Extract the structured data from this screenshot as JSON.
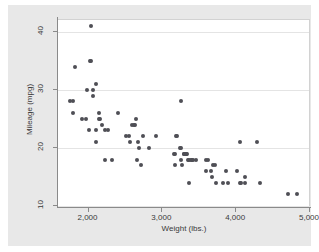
{
  "figure": {
    "background_color": "#e8e8e8",
    "plot_background_color": "#ffffff",
    "marker_color": "#4f4f55",
    "grid_color": "#e4e4e4",
    "axis_color": "#8a8a8a"
  },
  "chart_data": {
    "type": "scatter",
    "title": "",
    "xlabel": "Weight (lbs.)",
    "ylabel": "Mileage (mpg)",
    "xlim": [
      1600,
      5000
    ],
    "ylim": [
      10,
      42
    ],
    "xticks": [
      2000,
      3000,
      4000,
      5000
    ],
    "xtick_labels": [
      "2,000",
      "3,000",
      "4,000",
      "5,000"
    ],
    "yticks": [
      10,
      20,
      30,
      40
    ],
    "ytick_labels": [
      "10",
      "20",
      "30",
      "40"
    ],
    "grid": "horizontal",
    "legend": "none",
    "n_points": 74,
    "points": [
      [
        1760,
        28
      ],
      [
        1800,
        28
      ],
      [
        1800,
        26
      ],
      [
        1830,
        34
      ],
      [
        1930,
        25
      ],
      [
        1980,
        25
      ],
      [
        1990,
        30
      ],
      [
        2020,
        23
      ],
      [
        2040,
        35
      ],
      [
        2050,
        35
      ],
      [
        2050,
        41
      ],
      [
        2070,
        29
      ],
      [
        2070,
        30
      ],
      [
        2110,
        23
      ],
      [
        2120,
        21
      ],
      [
        2120,
        31
      ],
      [
        2160,
        26
      ],
      [
        2160,
        25
      ],
      [
        2170,
        25
      ],
      [
        2200,
        24
      ],
      [
        2230,
        23
      ],
      [
        2240,
        18
      ],
      [
        2280,
        23
      ],
      [
        2330,
        18
      ],
      [
        2410,
        26
      ],
      [
        2520,
        22
      ],
      [
        2560,
        22
      ],
      [
        2580,
        21
      ],
      [
        2600,
        24
      ],
      [
        2630,
        24
      ],
      [
        2640,
        24
      ],
      [
        2650,
        25
      ],
      [
        2670,
        18
      ],
      [
        2690,
        21
      ],
      [
        2700,
        20
      ],
      [
        2730,
        17
      ],
      [
        2750,
        22
      ],
      [
        2830,
        20
      ],
      [
        2930,
        22
      ],
      [
        3170,
        19
      ],
      [
        3180,
        19
      ],
      [
        3190,
        17
      ],
      [
        3200,
        22
      ],
      [
        3210,
        22
      ],
      [
        3250,
        20
      ],
      [
        3260,
        20
      ],
      [
        3260,
        28
      ],
      [
        3270,
        18
      ],
      [
        3280,
        17
      ],
      [
        3300,
        19
      ],
      [
        3310,
        19
      ],
      [
        3330,
        19
      ],
      [
        3340,
        19
      ],
      [
        3350,
        19
      ],
      [
        3360,
        18
      ],
      [
        3370,
        18
      ],
      [
        3380,
        14
      ],
      [
        3400,
        18
      ],
      [
        3420,
        18
      ],
      [
        3430,
        18
      ],
      [
        3470,
        18
      ],
      [
        3600,
        16
      ],
      [
        3610,
        18
      ],
      [
        3630,
        18
      ],
      [
        3670,
        16
      ],
      [
        3690,
        15
      ],
      [
        3700,
        17
      ],
      [
        3730,
        17
      ],
      [
        3740,
        14
      ],
      [
        3830,
        14
      ],
      [
        3880,
        16
      ],
      [
        3900,
        14
      ],
      [
        4030,
        16
      ],
      [
        4060,
        21
      ],
      [
        4060,
        14
      ],
      [
        4080,
        14
      ],
      [
        4130,
        15
      ],
      [
        4130,
        14
      ],
      [
        4290,
        21
      ],
      [
        4330,
        14
      ],
      [
        4720,
        12
      ],
      [
        4840,
        12
      ]
    ]
  }
}
